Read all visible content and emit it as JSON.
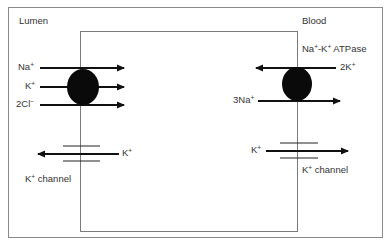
{
  "figure": {
    "regions": {
      "lumen": "Lumen",
      "blood": "Blood"
    },
    "left_membrane": {
      "cotransporter": {
        "ions": [
          {
            "base": "Na",
            "charge": "+",
            "direction": "into cell"
          },
          {
            "base": "K",
            "charge": "+",
            "direction": "into cell"
          },
          {
            "base": "2Cl",
            "charge": "−",
            "direction": "into cell"
          }
        ]
      },
      "channel": {
        "ion": {
          "base": "K",
          "charge": "+",
          "direction": "out to lumen"
        },
        "label_base": "K",
        "label_charge": "+",
        "label_rest": " channel"
      }
    },
    "right_membrane": {
      "pump": {
        "label_a": "Na",
        "label_a_charge": "+",
        "label_sep": "-K",
        "label_b_charge": "+",
        "label_rest": " ATPase",
        "ions": [
          {
            "base": "2K",
            "charge": "+",
            "direction": "into cell"
          },
          {
            "base": "3Na",
            "charge": "+",
            "direction": "out to blood"
          }
        ]
      },
      "channel": {
        "ion": {
          "base": "K",
          "charge": "+",
          "direction": "out to blood"
        },
        "label_base": "K",
        "label_charge": "+",
        "label_rest": " channel"
      }
    },
    "colors": {
      "frame": "#8a8a8a",
      "arrow": "#111111",
      "transporter": "#0a0a0a"
    }
  }
}
